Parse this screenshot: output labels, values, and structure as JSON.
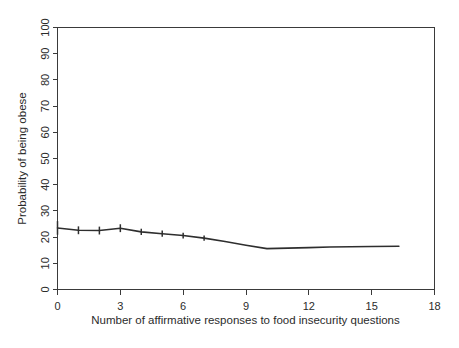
{
  "chart_data": {
    "type": "line",
    "title": "",
    "subtitle": "",
    "xlabel": "Number of affirmative responses to food insecurity questions",
    "ylabel": "Probability of being obese",
    "xlim": [
      0,
      18
    ],
    "ylim": [
      0,
      100
    ],
    "xticks": [
      0,
      3,
      6,
      9,
      12,
      15,
      18
    ],
    "xtick_labels": [
      "0",
      "3",
      "6",
      "9",
      "12",
      "15",
      "18"
    ],
    "yticks": [
      0,
      10,
      20,
      30,
      40,
      50,
      60,
      70,
      80,
      90,
      100
    ],
    "ytick_labels": [
      "0",
      "10",
      "20",
      "30",
      "40",
      "50",
      "60",
      "70",
      "80",
      "90",
      "100"
    ],
    "grid": false,
    "legend": "none",
    "line_color": "#2e2e2e",
    "axis_color": "#3a3a3a",
    "background_color": "#ffffff",
    "series": [
      {
        "name": "Probability of being obese",
        "x": [
          0,
          1,
          2,
          3,
          4,
          5,
          6,
          7,
          8,
          9,
          10,
          11,
          12,
          13,
          14,
          15,
          16.3
        ],
        "values": [
          23.5,
          22.6,
          22.5,
          23.4,
          22.0,
          21.3,
          20.6,
          19.6,
          18.3,
          16.9,
          15.6,
          15.8,
          16.0,
          16.2,
          16.3,
          16.4,
          16.5
        ]
      }
    ],
    "error_bars": {
      "note": "vertical tick marks drawn on the fitted line",
      "x": [
        0,
        1,
        2,
        3,
        4,
        5,
        6,
        7
      ],
      "y": [
        23.5,
        22.6,
        22.5,
        23.4,
        22.0,
        21.3,
        20.6,
        19.6
      ],
      "half_height": [
        2.6,
        1.5,
        1.5,
        1.5,
        1.2,
        1.2,
        1.1,
        1.0
      ]
    }
  },
  "figure": {
    "caption": ""
  }
}
